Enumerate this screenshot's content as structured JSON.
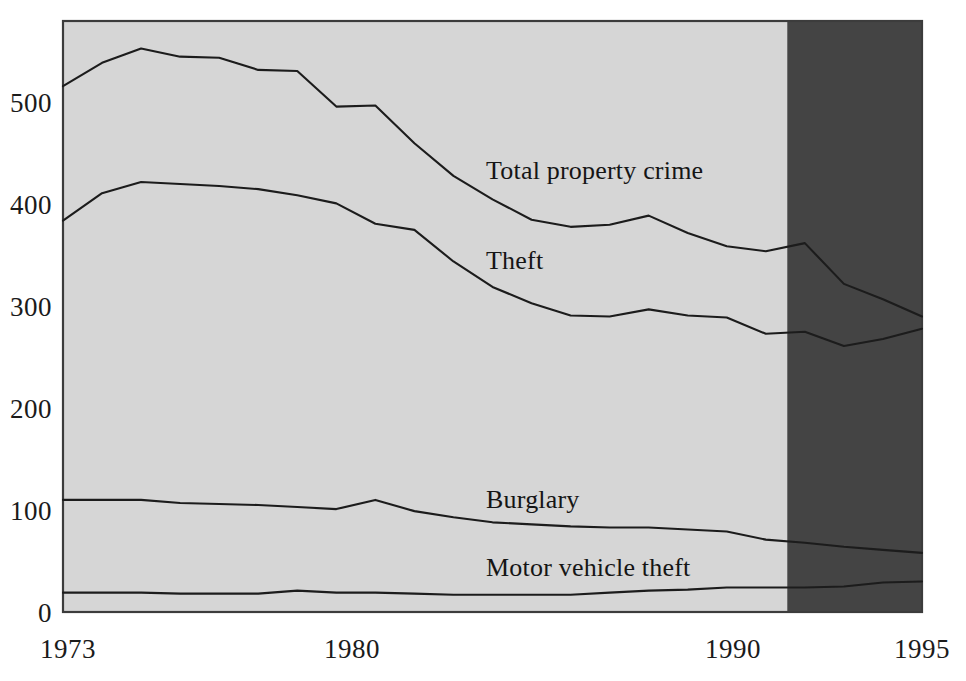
{
  "chart_data": {
    "type": "line",
    "title": "",
    "subtitle": "",
    "xlabel": "",
    "ylabel": "",
    "xlim": [
      1973,
      1995
    ],
    "ylim": [
      0,
      580
    ],
    "grid": false,
    "legend_position": "inline-annotations",
    "y_ticks": [
      0,
      100,
      200,
      300,
      400,
      500
    ],
    "y_tick_labels": [
      "0",
      "100",
      "200",
      "300",
      "400",
      "500"
    ],
    "x_ticks": [
      1973,
      1980,
      1990,
      1995
    ],
    "x_tick_labels": [
      "1973",
      "1980",
      "1990",
      "1995"
    ],
    "x": [
      1973,
      1974,
      1975,
      1976,
      1977,
      1978,
      1979,
      1980,
      1981,
      1982,
      1983,
      1984,
      1985,
      1986,
      1987,
      1988,
      1989,
      1990,
      1991,
      1992,
      1993,
      1994,
      1995
    ],
    "series": [
      {
        "name": "Total property crime",
        "label": "Total property crime",
        "color": "#1c1c1c",
        "values": [
          516,
          539,
          553,
          545,
          544,
          532,
          531,
          496,
          497,
          460,
          428,
          405,
          385,
          378,
          380,
          389,
          372,
          359,
          354,
          362,
          322,
          307,
          290
        ]
      },
      {
        "name": "Theft",
        "label": "Theft",
        "color": "#1c1c1c",
        "values": [
          384,
          411,
          422,
          420,
          418,
          415,
          409,
          401,
          381,
          375,
          344,
          319,
          303,
          291,
          290,
          297,
          291,
          289,
          273,
          275,
          261,
          268,
          278
        ]
      },
      {
        "name": "Burglary",
        "label": "Burglary",
        "color": "#1c1c1c",
        "values": [
          110,
          110,
          110,
          107,
          106,
          105,
          103,
          101,
          110,
          99,
          93,
          88,
          86,
          84,
          83,
          83,
          81,
          79,
          71,
          68,
          64,
          61,
          58
        ]
      },
      {
        "name": "Motor vehicle theft",
        "label": "Motor vehicle theft",
        "color": "#1c1c1c",
        "values": [
          19,
          19,
          19,
          18,
          18,
          18,
          21,
          19,
          19,
          18,
          17,
          17,
          17,
          17,
          19,
          21,
          22,
          24,
          24,
          24,
          25,
          29,
          30
        ]
      }
    ],
    "annotations": [
      {
        "text": "Total property crime",
        "x": 1984.0,
        "y": 440
      },
      {
        "text": "Theft",
        "x": 1984.0,
        "y": 312
      },
      {
        "text": "Burglary",
        "x": 1984.2,
        "y": 128
      },
      {
        "text": "Motor vehicle theft",
        "x": 1984.2,
        "y": 55
      }
    ],
    "shaded_regions": [
      {
        "name": "redesign-region",
        "x_start": 1991.55,
        "x_end": 1995,
        "color": "#444444"
      }
    ],
    "plot_background": "#d6d6d6",
    "frame_color": "#3c3c3c"
  },
  "axis": {
    "y_labels": [
      "500",
      "400",
      "300",
      "200",
      "100",
      "0"
    ],
    "x_labels": [
      "1973",
      "1980",
      "1990",
      "1995"
    ]
  },
  "labels": {
    "total_property_crime": "Total property crime",
    "theft": "Theft",
    "burglary": "Burglary",
    "motor_vehicle_theft": "Motor vehicle theft"
  }
}
